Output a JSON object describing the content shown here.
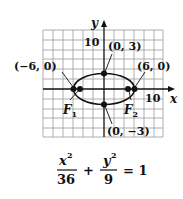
{
  "axes": {
    "x_label": "x",
    "y_label": "y",
    "x_tick_label": "10",
    "y_tick_label": "10"
  },
  "points": {
    "left_vertex": "(−6, 0)",
    "right_vertex": "(6, 0)",
    "top_vertex": "(0, 3)",
    "bottom_vertex": "(0, −3)"
  },
  "foci": {
    "f1": "F",
    "f1_sub": "1",
    "f2": "F",
    "f2_sub": "2"
  },
  "equation": {
    "term1_num": "x",
    "term1_exp": "2",
    "term1_den": "36",
    "plus": "+",
    "term2_num": "y",
    "term2_exp": "2",
    "term2_den": "9",
    "equals": "= 1"
  },
  "colors": {
    "ink": "#111111",
    "grid": "#9a9a9a"
  }
}
